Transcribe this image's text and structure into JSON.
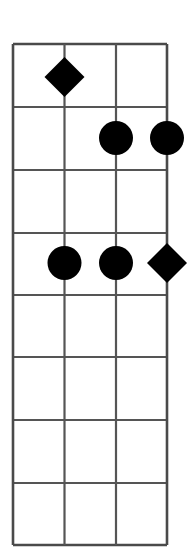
{
  "diagram": {
    "kind": "fretboard-chord-diagram",
    "instrument_strings": 4,
    "fret_count": 8,
    "title": "",
    "colors": {
      "background": "#ffffff",
      "grid_line": "#555555",
      "outer_border": "#4a4a4a",
      "marker_fill": "#000000"
    },
    "geometry": {
      "left": 13,
      "right": 167,
      "top": 44,
      "bottom": 545,
      "string_x": [
        13,
        64.5,
        116,
        167
      ],
      "fret_y": [
        44,
        107,
        170,
        233,
        295,
        357,
        420,
        483,
        545
      ],
      "grid_line_width": 2.2,
      "outer_line_width": 2.6
    },
    "string_labels": [
      "string-1",
      "string-2",
      "string-3",
      "string-4"
    ],
    "fret_labels": [
      "fret-1",
      "fret-2",
      "fret-3",
      "fret-4",
      "fret-5",
      "fret-6",
      "fret-7",
      "fret-8"
    ],
    "markers": [
      {
        "id": "marker-diamond-s2-f1",
        "shape": "diamond",
        "string": 2,
        "fret": 1,
        "cx": 64.5,
        "cy": 77,
        "size": 40,
        "fill": "#000000"
      },
      {
        "id": "marker-circle-s3-f2",
        "shape": "circle",
        "string": 3,
        "fret": 2,
        "cx": 116,
        "cy": 138,
        "size": 34,
        "fill": "#000000"
      },
      {
        "id": "marker-circle-s4-f2",
        "shape": "circle",
        "string": 4,
        "fret": 2,
        "cx": 167,
        "cy": 138,
        "size": 34,
        "fill": "#000000"
      },
      {
        "id": "marker-circle-s2-f4",
        "shape": "circle",
        "string": 2,
        "fret": 4,
        "cx": 64.5,
        "cy": 263,
        "size": 34,
        "fill": "#000000"
      },
      {
        "id": "marker-circle-s3-f4",
        "shape": "circle",
        "string": 3,
        "fret": 4,
        "cx": 116,
        "cy": 263,
        "size": 34,
        "fill": "#000000"
      },
      {
        "id": "marker-diamond-s4-f4",
        "shape": "diamond",
        "string": 4,
        "fret": 4,
        "cx": 167,
        "cy": 263,
        "size": 40,
        "fill": "#000000"
      }
    ]
  }
}
